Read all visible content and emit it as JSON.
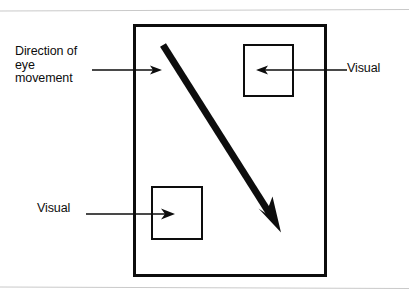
{
  "figure": {
    "type": "schematic-diagram",
    "colors": {
      "ink": "#0d0d0d",
      "background": "#ffffff",
      "scan_line": "#c9c9c9"
    },
    "frame": {
      "name": "visual-field-rectangle",
      "x": 133,
      "y": 24,
      "width": 194,
      "height": 253,
      "stroke_width": 3
    },
    "eye_movement_arrow": {
      "name": "eye-movement-arrow",
      "description": "thick diagonal arrow from upper-left to lower-right",
      "start": [
        163,
        45
      ],
      "end": [
        280,
        230
      ],
      "stroke_width": 7,
      "arrowhead": "solid-triangle"
    },
    "targets": [
      {
        "name": "visual-target-top-right",
        "x": 243,
        "y": 44,
        "width": 51,
        "height": 53,
        "stroke_width": 2
      },
      {
        "name": "visual-target-bottom-left",
        "x": 151,
        "y": 186,
        "width": 52,
        "height": 54,
        "stroke_width": 2
      }
    ],
    "labels": {
      "direction": {
        "text": "Direction of\neye\nmovement",
        "lines": [
          "Direction of",
          "eye",
          "movement"
        ],
        "leader": {
          "name": "direction-leader-line",
          "from": [
            92,
            70
          ],
          "to": [
            161,
            70
          ],
          "arrowhead": "open-right"
        }
      },
      "visual_right": {
        "text": "Visual",
        "leader": {
          "name": "visual-right-leader-line",
          "from": [
            348,
            70
          ],
          "to": [
            258,
            70
          ],
          "arrowhead": "open-left"
        }
      },
      "visual_left": {
        "text": "Visual",
        "leader": {
          "name": "visual-left-leader-line",
          "from": [
            87,
            214
          ],
          "to": [
            172,
            214
          ],
          "arrowhead": "open-right"
        }
      }
    },
    "scan_lines": [
      {
        "name": "scan-line-top",
        "y": 11
      },
      {
        "name": "scan-line-bottom",
        "y": 288
      }
    ]
  }
}
